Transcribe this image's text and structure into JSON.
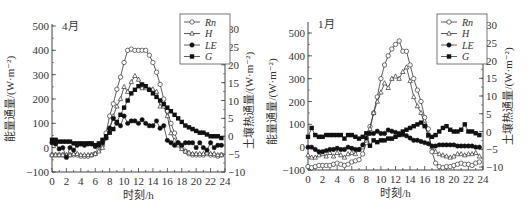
{
  "chart_data": [
    {
      "type": "line",
      "title": "4月",
      "xlabel": "时刻/h",
      "ylabel": "能量通量/(W·m⁻²)",
      "y2label": "土壤热通量/(W·m⁻²)",
      "xlim": [
        0,
        24
      ],
      "ylim": [
        -100,
        500
      ],
      "y2lim": [
        -10,
        30
      ],
      "xticks": [
        0,
        2,
        4,
        6,
        8,
        10,
        12,
        14,
        16,
        18,
        20,
        22,
        24
      ],
      "yticks": [
        -100,
        0,
        100,
        200,
        300,
        400,
        500
      ],
      "y2ticks": [
        -10,
        -5,
        0,
        5,
        10,
        15,
        20,
        25,
        30
      ],
      "grid": false,
      "legend_position": "top-right",
      "x": [
        0,
        0.5,
        1,
        1.5,
        2,
        2.5,
        3,
        3.5,
        4,
        4.5,
        5,
        5.5,
        6,
        6.5,
        7,
        7.5,
        8,
        8.5,
        9,
        9.5,
        10,
        10.5,
        11,
        11.5,
        12,
        12.5,
        13,
        13.5,
        14,
        14.5,
        15,
        15.5,
        16,
        16.5,
        17,
        17.5,
        18,
        18.5,
        19,
        19.5,
        20,
        20.5,
        21,
        21.5,
        22,
        22.5,
        23,
        23.5
      ],
      "series": [
        {
          "name": "Rn",
          "marker": "open-circle",
          "axis": "left",
          "values": [
            -30,
            -30,
            -30,
            -30,
            -35,
            -30,
            -30,
            -30,
            -35,
            -35,
            -35,
            -30,
            -25,
            -10,
            10,
            60,
            130,
            180,
            240,
            290,
            350,
            400,
            405,
            400,
            400,
            400,
            400,
            380,
            350,
            310,
            260,
            200,
            150,
            100,
            60,
            20,
            0,
            -15,
            -25,
            -30,
            -30,
            -30,
            -30,
            -25,
            -30,
            -30,
            -35,
            -30
          ]
        },
        {
          "name": "H",
          "marker": "open-triangle",
          "axis": "left",
          "values": [
            -30,
            -30,
            -30,
            -30,
            -30,
            -30,
            -25,
            -25,
            -30,
            -30,
            -30,
            -30,
            -25,
            -15,
            0,
            40,
            80,
            130,
            170,
            200,
            250,
            230,
            270,
            295,
            280,
            245,
            245,
            240,
            240,
            230,
            170,
            170,
            130,
            60,
            30,
            10,
            -5,
            -15,
            -20,
            -25,
            -25,
            -25,
            -25,
            -20,
            -25,
            -25,
            -30,
            -30
          ]
        },
        {
          "name": "LE",
          "marker": "filled-circle",
          "axis": "left",
          "values": [
            20,
            15,
            -5,
            0,
            -40,
            0,
            -10,
            10,
            15,
            10,
            15,
            15,
            5,
            10,
            20,
            40,
            80,
            120,
            100,
            90,
            130,
            100,
            110,
            110,
            100,
            115,
            100,
            90,
            90,
            110,
            80,
            90,
            30,
            20,
            10,
            20,
            10,
            20,
            20,
            20,
            0,
            20,
            0,
            -10,
            20,
            0,
            10,
            10
          ]
        },
        {
          "name": "G",
          "marker": "filled-square",
          "axis": "right",
          "values": [
            -1,
            -1,
            -1.5,
            -1.5,
            -1.5,
            -1.5,
            -2,
            -2,
            -2,
            -2,
            -2,
            -2,
            -2.5,
            -2,
            -1,
            0,
            1,
            2,
            4,
            6,
            8,
            10,
            12,
            13,
            14,
            14.5,
            14,
            13,
            12,
            11,
            10,
            9,
            8,
            7,
            6,
            5,
            4,
            3,
            2.5,
            2,
            1.5,
            1,
            1,
            0.5,
            0,
            0,
            0,
            -0.5
          ]
        }
      ]
    },
    {
      "type": "line",
      "title": "1月",
      "xlabel": "时刻/h",
      "ylabel": "能量通量/(W·m⁻²)",
      "y2label": "土壤热通量/(W·m⁻²)",
      "xlim": [
        0,
        24
      ],
      "ylim": [
        -150,
        550
      ],
      "y2lim": [
        -10,
        30
      ],
      "xticks": [
        0,
        2,
        4,
        6,
        8,
        10,
        12,
        14,
        16,
        18,
        20,
        22,
        24
      ],
      "yticks": [
        -100,
        0,
        100,
        200,
        300,
        400,
        500
      ],
      "y2ticks": [
        -10,
        -5,
        0,
        5,
        10,
        15,
        20,
        25,
        30
      ],
      "grid": false,
      "legend_position": "top-right",
      "x": [
        0,
        0.5,
        1,
        1.5,
        2,
        2.5,
        3,
        3.5,
        4,
        4.5,
        5,
        5.5,
        6,
        6.5,
        7,
        7.5,
        8,
        8.5,
        9,
        9.5,
        10,
        10.5,
        11,
        11.5,
        12,
        12.5,
        13,
        13.5,
        14,
        14.5,
        15,
        15.5,
        16,
        16.5,
        17,
        17.5,
        18,
        18.5,
        19,
        19.5,
        20,
        20.5,
        21,
        21.5,
        22,
        22.5,
        23,
        23.5
      ],
      "series": [
        {
          "name": "Rn",
          "marker": "open-circle",
          "axis": "left",
          "values": [
            -85,
            -90,
            -85,
            -80,
            -80,
            -80,
            -80,
            -75,
            -70,
            -75,
            -80,
            -75,
            -65,
            -60,
            -55,
            -30,
            20,
            90,
            150,
            220,
            300,
            360,
            400,
            430,
            450,
            465,
            420,
            420,
            360,
            300,
            250,
            200,
            130,
            80,
            -20,
            -70,
            -85,
            -90,
            -85,
            -85,
            -80,
            -75,
            -70,
            -75,
            -75,
            -80,
            -70,
            -65
          ]
        },
        {
          "name": "H",
          "marker": "open-triangle",
          "axis": "left",
          "values": [
            -35,
            -45,
            -45,
            -35,
            -30,
            -40,
            -25,
            -40,
            -25,
            -35,
            -45,
            -30,
            -25,
            -30,
            -10,
            0,
            30,
            80,
            150,
            200,
            240,
            280,
            260,
            300,
            310,
            300,
            330,
            350,
            290,
            220,
            180,
            150,
            100,
            50,
            0,
            -20,
            -30,
            -35,
            -40,
            -45,
            -40,
            -30,
            -30,
            -35,
            -30,
            -30,
            -25,
            -40
          ]
        },
        {
          "name": "LE",
          "marker": "filled-circle",
          "axis": "left",
          "values": [
            0,
            0,
            -10,
            -20,
            -20,
            -15,
            -10,
            -10,
            -5,
            -10,
            -10,
            0,
            -5,
            -10,
            -10,
            10,
            40,
            60,
            60,
            70,
            60,
            60,
            75,
            70,
            65,
            60,
            55,
            50,
            40,
            30,
            30,
            25,
            20,
            15,
            5,
            5,
            10,
            10,
            10,
            10,
            10,
            5,
            5,
            5,
            5,
            5,
            0,
            0
          ]
        },
        {
          "name": "G",
          "marker": "filled-square",
          "axis": "right",
          "values": [
            -1.5,
            1,
            -1,
            -1.5,
            -1.5,
            -1,
            -1,
            -1,
            -1,
            -1,
            -2,
            -1,
            -1,
            -1.5,
            -2,
            -1.5,
            -0.5,
            -4,
            -2.5,
            -3,
            -2.5,
            -2.5,
            -2,
            -2,
            -1.5,
            -1,
            0,
            0.5,
            1,
            1.5,
            2,
            2.5,
            1.5,
            -1,
            -1.5,
            -1,
            0,
            1,
            1.5,
            0.5,
            0,
            0,
            0.5,
            2,
            0,
            0,
            -0.5,
            -1
          ]
        }
      ]
    }
  ],
  "charts": [
    {
      "title": "4月",
      "xlabel": "时刻/h",
      "ylabel": "能量通量/(W·m⁻²)",
      "y2label": "土壤热通量/(W·m⁻²)",
      "legend": [
        "Rn",
        "H",
        "LE",
        "G"
      ]
    },
    {
      "title": "1月",
      "xlabel": "时刻/h",
      "ylabel": "能量通量/(W·m⁻²)",
      "y2label": "土壤热通量/(W·m⁻²)",
      "legend": [
        "Rn",
        "H",
        "LE",
        "G"
      ]
    }
  ]
}
